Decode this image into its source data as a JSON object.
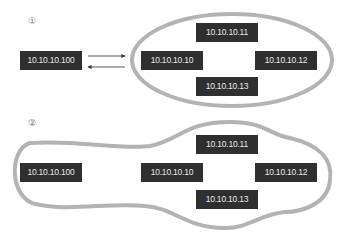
{
  "diagrams": [
    {
      "label": "①",
      "nodes": {
        "external": "10.10.10.100",
        "n10": "10.10.10.10",
        "n11": "10.10.10.11",
        "n12": "10.10.10.12",
        "n13": "10.10.10.13"
      },
      "arrows": [
        "to-cluster",
        "from-cluster"
      ]
    },
    {
      "label": "②",
      "nodes": {
        "external": "10.10.10.100",
        "n10": "10.10.10.10",
        "n11": "10.10.10.11",
        "n12": "10.10.10.12",
        "n13": "10.10.10.13"
      }
    }
  ],
  "colors": {
    "node_bg": "#2f2f2f",
    "node_text": "#e8e8e8",
    "boundary": "#b3b3b3",
    "arrow": "#333333"
  }
}
